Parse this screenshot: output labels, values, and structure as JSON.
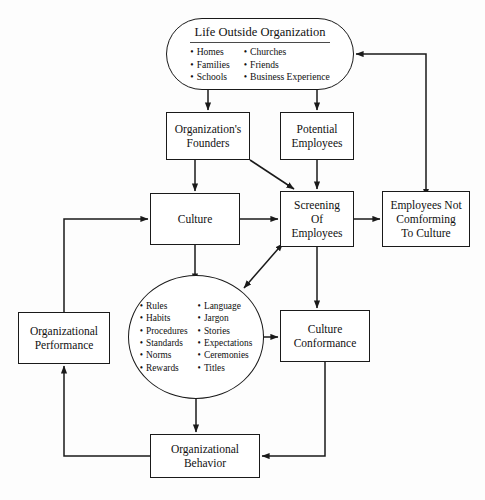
{
  "diagram": {
    "type": "flowchart",
    "line_color": "#1a1a1a",
    "background_color": "#fdfdfd"
  },
  "nodes": {
    "life_outside": {
      "heading": "Life Outside Organization",
      "shape": "stadium",
      "bullets_left": [
        "Homes",
        "Families",
        "Schools"
      ],
      "bullets_right": [
        "Churches",
        "Friends",
        "Business Experience"
      ]
    },
    "founders": {
      "label": "Organization's\nFounders",
      "shape": "rectangle"
    },
    "potential_employees": {
      "label": "Potential\nEmployees",
      "shape": "rectangle"
    },
    "culture": {
      "label": "Culture",
      "shape": "rectangle"
    },
    "screening": {
      "label": "Screening\nOf\nEmployees",
      "shape": "rectangle"
    },
    "nonconforming": {
      "label": "Employees Not\nComforming\nTo Culture",
      "shape": "rectangle"
    },
    "org_performance": {
      "label": "Organizational\nPerformance",
      "shape": "rectangle"
    },
    "conformance": {
      "label": "Culture\nConformance",
      "shape": "rectangle"
    },
    "org_behavior": {
      "label": "Organizational\nBehavior",
      "shape": "rectangle"
    },
    "core": {
      "shape": "ellipse",
      "bullets_left": [
        "Rules",
        "Habits",
        "Procedures",
        "Standards",
        "Norms",
        "Rewards"
      ],
      "bullets_right": [
        "Language",
        "Jargon",
        "Stories",
        "Expectations",
        "Ceremonies",
        "Titles"
      ]
    }
  },
  "edges": [
    {
      "from": "life_outside",
      "to": "founders",
      "style": "arrow"
    },
    {
      "from": "life_outside",
      "to": "potential_employees",
      "style": "arrow"
    },
    {
      "from": "founders",
      "to": "culture",
      "style": "arrow"
    },
    {
      "from": "founders",
      "to": "screening",
      "style": "arrow"
    },
    {
      "from": "potential_employees",
      "to": "screening",
      "style": "arrow"
    },
    {
      "from": "culture",
      "to": "screening",
      "style": "arrow"
    },
    {
      "from": "culture",
      "to": "core",
      "style": "arrow"
    },
    {
      "from": "screening",
      "to": "nonconforming",
      "style": "arrow"
    },
    {
      "from": "screening",
      "to": "conformance",
      "style": "arrow"
    },
    {
      "from": "screening",
      "to": "core",
      "style": "double-arrow"
    },
    {
      "from": "nonconforming",
      "to": "life_outside",
      "style": "double-arrow"
    },
    {
      "from": "conformance",
      "to": "core",
      "style": "double-arrow"
    },
    {
      "from": "conformance",
      "to": "org_behavior",
      "style": "arrow"
    },
    {
      "from": "core",
      "to": "org_behavior",
      "style": "arrow"
    },
    {
      "from": "org_behavior",
      "to": "org_performance",
      "style": "arrow"
    },
    {
      "from": "org_performance",
      "to": "culture",
      "style": "arrow"
    },
    {
      "from": "core",
      "to": "org_performance",
      "style": "arrow"
    }
  ]
}
